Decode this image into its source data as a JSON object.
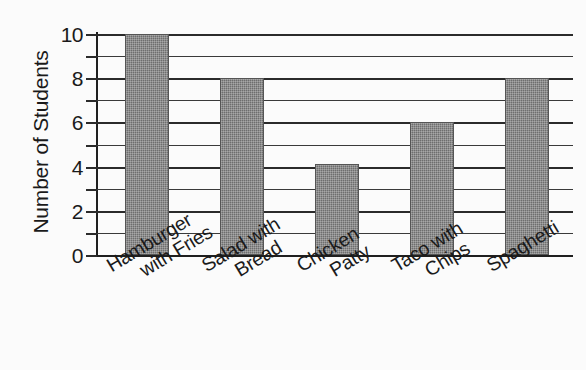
{
  "chart_data": {
    "type": "bar",
    "title": "",
    "xlabel": "",
    "ylabel": "Number of Students",
    "categories": [
      "Hamburger with Fries",
      "Salad with Bread",
      "Chicken Patty",
      "Taco with Chips",
      "Spaghetti"
    ],
    "category_lines": [
      [
        "Hamburger",
        "with Fries"
      ],
      [
        "Salad with",
        "Bread"
      ],
      [
        "Chicken",
        "Patty"
      ],
      [
        "Taco with",
        "Chips"
      ],
      [
        "Spaghetti",
        ""
      ]
    ],
    "values": [
      10,
      8,
      4.1,
      6,
      8
    ],
    "ylim": [
      0,
      10
    ],
    "y_major_ticks": [
      0,
      2,
      4,
      6,
      8,
      10
    ],
    "y_minor_ticks": [
      1,
      3,
      5,
      7,
      9
    ],
    "y_tick_labels": [
      "0",
      "2",
      "4",
      "6",
      "8",
      "10"
    ],
    "grid": "horizontal-every-1-unit",
    "legend": "none",
    "bar_color": "#6e6e6e",
    "axis_color": "#1f1f1f",
    "background_color": "#fbfbfb"
  }
}
